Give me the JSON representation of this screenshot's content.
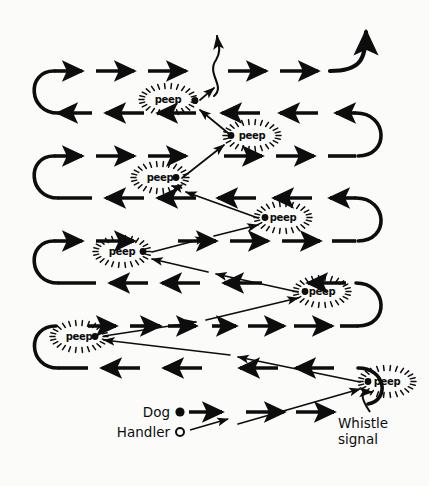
{
  "figure": {
    "background_color": "#fbfbfa",
    "ink_color": "#0d0d0d",
    "width": 429,
    "height": 486
  },
  "legend": {
    "dog_label": "Dog",
    "dog_marker": "filled-dot",
    "handler_label": "Handler",
    "handler_marker": "open-circle",
    "whistle_label_line1": "Whistle",
    "whistle_label_line2": "signal"
  },
  "peep": {
    "label": "peep",
    "count": 7,
    "markers": [
      {
        "id": 1,
        "x": 168,
        "y": 103,
        "dot_x": 195,
        "dot_y": 104
      },
      {
        "id": 2,
        "x": 252,
        "y": 139,
        "dot_x": 231,
        "dot_y": 139
      },
      {
        "id": 3,
        "x": 160,
        "y": 181,
        "dot_x": 176,
        "dot_y": 181
      },
      {
        "id": 4,
        "x": 283,
        "y": 221,
        "dot_x": 265,
        "dot_y": 221
      },
      {
        "id": 5,
        "x": 122,
        "y": 255,
        "dot_x": 143,
        "dot_y": 255
      },
      {
        "id": 6,
        "x": 322,
        "y": 295,
        "dot_x": 305,
        "dot_y": 295
      },
      {
        "id": 7,
        "x": 79,
        "y": 340,
        "dot_x": 95,
        "dot_y": 340
      },
      {
        "id": 8,
        "x": 387,
        "y": 385,
        "dot_x": 368,
        "dot_y": 385
      }
    ]
  },
  "dog_path": {
    "description": "Boustrophedon quartering sweeps, alternating left-to-right and right-to-left, joined by U-turns at each end.",
    "rows": [
      {
        "index": 1,
        "y": 71,
        "direction": "right",
        "x_start": 52,
        "x_end": 358
      },
      {
        "index": 2,
        "y": 113,
        "direction": "left",
        "x_start": 358,
        "x_end": 52
      },
      {
        "index": 3,
        "y": 156,
        "direction": "right",
        "x_start": 52,
        "x_end": 358
      },
      {
        "index": 4,
        "y": 198,
        "direction": "left",
        "x_start": 358,
        "x_end": 52
      },
      {
        "index": 5,
        "y": 241,
        "direction": "right",
        "x_start": 52,
        "x_end": 358
      },
      {
        "index": 6,
        "y": 283,
        "direction": "left",
        "x_start": 358,
        "x_end": 52
      },
      {
        "index": 7,
        "y": 326,
        "direction": "right",
        "x_start": 52,
        "x_end": 358
      },
      {
        "index": 8,
        "y": 368,
        "direction": "left",
        "x_start": 358,
        "x_end": 52
      }
    ],
    "exits": [
      {
        "name": "centre-wavy-exit",
        "x": 218,
        "y": 71
      },
      {
        "name": "top-right-exit",
        "x": 360,
        "y": 71
      }
    ]
  },
  "handler_path": {
    "description": "Thin zig-zag line from handler at bottom up to the top, meeting the dog at each whistle point.",
    "points": [
      {
        "x": 232,
        "y": 424
      },
      {
        "x": 368,
        "y": 385
      },
      {
        "x": 95,
        "y": 340
      },
      {
        "x": 305,
        "y": 295
      },
      {
        "x": 143,
        "y": 255
      },
      {
        "x": 265,
        "y": 221
      },
      {
        "x": 176,
        "y": 181
      },
      {
        "x": 231,
        "y": 139
      },
      {
        "x": 195,
        "y": 104
      },
      {
        "x": 216,
        "y": 80
      }
    ]
  }
}
